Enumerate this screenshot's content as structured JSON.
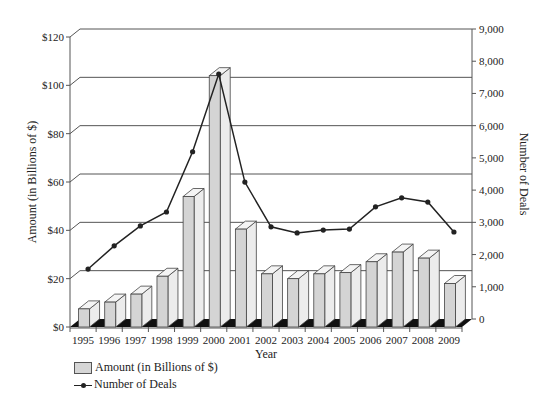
{
  "chart_data": {
    "type": "bar+line",
    "title": "",
    "categories": [
      "1995",
      "1996",
      "1997",
      "1998",
      "1999",
      "2000",
      "2001",
      "2002",
      "2003",
      "2004",
      "2005",
      "2006",
      "2007",
      "2008",
      "2009"
    ],
    "series": [
      {
        "name": "Amount (in Billions of $)",
        "type": "bar",
        "axis": "left",
        "values": [
          7.5,
          10.3,
          13.6,
          21,
          54,
          104,
          40.5,
          22,
          20,
          22,
          22.5,
          27,
          31,
          28.5,
          18
        ]
      },
      {
        "name": "Number of Deals",
        "type": "line",
        "axis": "right",
        "values": [
          1550,
          2270,
          2890,
          3320,
          5190,
          7600,
          4250,
          2860,
          2670,
          2760,
          2790,
          3480,
          3760,
          3630,
          2700
        ]
      }
    ],
    "xlabel": "Year",
    "ylabel": "Amount (in Billions of $)",
    "y2label": "Number of Deals",
    "ylim": [
      0,
      120
    ],
    "y2lim": [
      0,
      9000
    ],
    "yticks": [
      "$0",
      "$20",
      "$40",
      "$60",
      "$80",
      "$100",
      "$120"
    ],
    "y2ticks": [
      "0",
      "1,000",
      "2,000",
      "3,000",
      "4,000",
      "5,000",
      "6,000",
      "7,000",
      "8,000",
      "9,000"
    ],
    "grid": true,
    "legend_position": "bottom-left",
    "style": "3d"
  },
  "legend": {
    "items": [
      {
        "label": "Amount (in Billions of $)",
        "kind": "bar"
      },
      {
        "label": "Number of Deals",
        "kind": "line"
      }
    ]
  },
  "colors": {
    "bar_front": "#d4d4d4",
    "bar_side": "#ececec",
    "bar_top": "#f4f4f4",
    "floor": "#111111",
    "line": "#222222",
    "grid": "#555555"
  }
}
